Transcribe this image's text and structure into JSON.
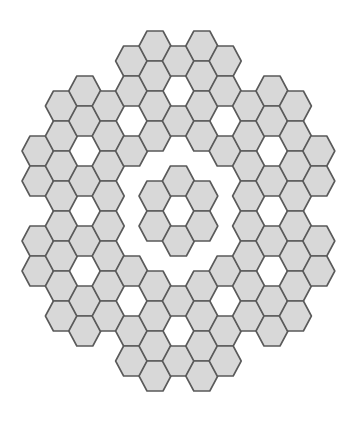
{
  "figure": {
    "hex_orientation": "flat-top",
    "fill_color": "#d8d8d8",
    "stroke_color": "#5a5a5a",
    "background_color": "#ffffff"
  },
  "grid": {
    "origin_x": 38,
    "col_spacing": 23.4,
    "origin_y": 31,
    "row_half_spacing": 15,
    "hex_half_width": 16,
    "hex_half_height": 15,
    "columns": [
      {
        "col": 0,
        "rows": [
          8,
          10,
          14,
          16
        ]
      },
      {
        "col": 1,
        "rows": [
          5,
          7,
          9,
          11,
          13,
          15,
          17,
          19
        ]
      },
      {
        "col": 2,
        "rows": [
          4,
          6,
          10,
          14,
          18,
          20
        ]
      },
      {
        "col": 3,
        "rows": [
          5,
          7,
          9,
          11,
          13,
          15,
          17,
          19
        ]
      },
      {
        "col": 4,
        "rows": [
          2,
          4,
          8,
          16,
          20,
          22
        ]
      },
      {
        "col": 5,
        "rows": [
          1,
          3,
          5,
          7,
          11,
          13,
          17,
          19,
          21,
          23
        ]
      },
      {
        "col": 6,
        "rows": [
          2,
          6,
          10,
          14,
          18,
          22
        ]
      },
      {
        "col": 7,
        "rows": [
          1,
          3,
          5,
          7,
          11,
          13,
          17,
          19,
          21,
          23
        ]
      },
      {
        "col": 8,
        "rows": [
          2,
          4,
          8,
          16,
          20,
          22
        ]
      },
      {
        "col": 9,
        "rows": [
          5,
          7,
          9,
          11,
          13,
          15,
          17,
          19
        ]
      },
      {
        "col": 10,
        "rows": [
          4,
          6,
          10,
          14,
          18,
          20
        ]
      },
      {
        "col": 11,
        "rows": [
          5,
          7,
          9,
          11,
          13,
          15,
          17,
          19
        ]
      },
      {
        "col": 12,
        "rows": [
          8,
          10,
          14,
          16
        ]
      }
    ]
  }
}
